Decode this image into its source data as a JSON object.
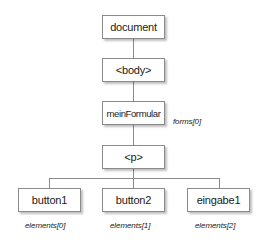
{
  "diagram": {
    "type": "tree",
    "colors": {
      "box_border": "#8a8a8a",
      "box_fill": "#ffffff",
      "text": "#1a1a1a",
      "connector": "#8a8a8a"
    },
    "nodes": {
      "document": {
        "label": "document"
      },
      "body": {
        "label": "<body>"
      },
      "form": {
        "label": "meinFormular",
        "annotation": "forms[0]"
      },
      "p": {
        "label": "<p>"
      },
      "button1": {
        "label": "button1",
        "annotation": "elements[0]"
      },
      "button2": {
        "label": "button2",
        "annotation": "elements[1]"
      },
      "eingabe1": {
        "label": "eingabe1",
        "annotation": "elements[2]"
      }
    },
    "edges": [
      [
        "document",
        "body"
      ],
      [
        "body",
        "form"
      ],
      [
        "form",
        "p"
      ],
      [
        "p",
        "button1"
      ],
      [
        "p",
        "button2"
      ],
      [
        "p",
        "eingabe1"
      ]
    ]
  }
}
